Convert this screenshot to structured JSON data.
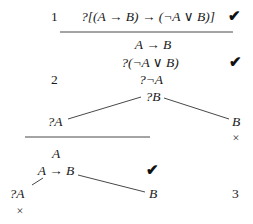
{
  "diagram": {
    "type": "tableau-proof",
    "labels": {
      "step1": "1",
      "step2": "2",
      "step3": "3"
    },
    "nodes": {
      "goal": "?[(A → B) → (¬A ∨ B)]",
      "premise_impl": "A → B",
      "subgoal_disj": "?(¬A ∨ B)",
      "subgoal_negA": "?¬A",
      "subgoal_B": "?B",
      "branch_left_qA": "?A",
      "branch_right_B": "B",
      "assumption_A": "A",
      "impl_again": "A → B",
      "leaf_qA": "?A",
      "leaf_B": "B"
    },
    "marks": {
      "check": "✔",
      "cross": "×"
    }
  }
}
